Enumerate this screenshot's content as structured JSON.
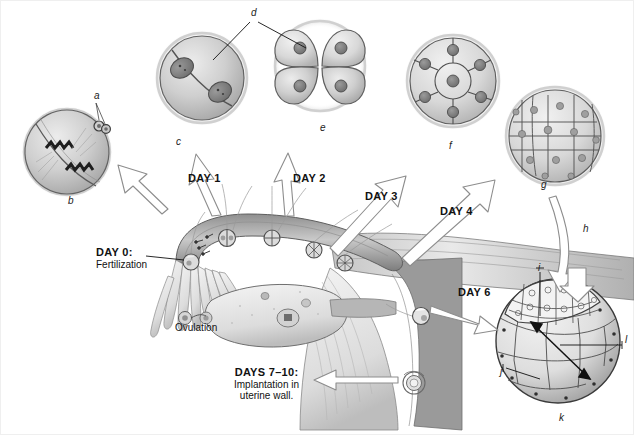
{
  "figure": {
    "background": "#ffffff",
    "ink": "#111111"
  },
  "timeline_labels": [
    {
      "id": "day0",
      "text": "DAY 0:",
      "sub": "Fertilization",
      "x": 96,
      "y": 252
    },
    {
      "id": "day1",
      "text": "DAY 1",
      "sub": "",
      "x": 188,
      "y": 178
    },
    {
      "id": "day2",
      "text": "DAY 2",
      "sub": "",
      "x": 293,
      "y": 178
    },
    {
      "id": "day3",
      "text": "DAY 3",
      "sub": "",
      "x": 365,
      "y": 196
    },
    {
      "id": "day4",
      "text": "DAY 4",
      "sub": "",
      "x": 440,
      "y": 211
    },
    {
      "id": "day6",
      "text": "DAY 6",
      "sub": "",
      "x": 458,
      "y": 292
    },
    {
      "id": "days710",
      "text": "DAYS 7–10:",
      "sub": "Implantation in\nuterine wall.",
      "x": 234,
      "y": 373
    }
  ],
  "anatomy_labels": [
    {
      "id": "ovulation",
      "text": "Ovulation",
      "x": 175,
      "y": 328
    }
  ],
  "stage_letters": [
    {
      "id": "a",
      "text": "a",
      "x": 94,
      "y": 96,
      "role": "polar-bodies"
    },
    {
      "id": "b",
      "text": "b",
      "x": 68,
      "y": 201,
      "role": "zygote-first-cleavage"
    },
    {
      "id": "c",
      "text": "c",
      "x": 176,
      "y": 142,
      "role": "two-cell-stage"
    },
    {
      "id": "d",
      "text": "d",
      "x": 251,
      "y": 13,
      "role": "blastomere"
    },
    {
      "id": "e",
      "text": "e",
      "x": 320,
      "y": 128,
      "role": "four-cell-stage"
    },
    {
      "id": "f",
      "text": "f",
      "x": 449,
      "y": 146,
      "role": "eight-cell-stage"
    },
    {
      "id": "g",
      "text": "g",
      "x": 541,
      "y": 185,
      "role": "morula"
    },
    {
      "id": "h",
      "text": "h",
      "x": 583,
      "y": 229,
      "role": "zona-pellucida"
    },
    {
      "id": "i",
      "text": "i",
      "x": 538,
      "y": 275,
      "role": "inner-cell-mass"
    },
    {
      "id": "j",
      "text": "j",
      "x": 502,
      "y": 372,
      "role": "blastocoel"
    },
    {
      "id": "k",
      "text": "k",
      "x": 559,
      "y": 419,
      "role": "blastocyst"
    },
    {
      "id": "l",
      "text": "l",
      "x": 625,
      "y": 340,
      "role": "trophoblast"
    }
  ],
  "embryo_stages": [
    {
      "id": "b",
      "cx": 67,
      "cy": 152,
      "r": 45,
      "cells": 2,
      "label": "b",
      "caption": "zygote, first cleavage"
    },
    {
      "id": "c",
      "cx": 202,
      "cy": 78,
      "r": 46,
      "cells": 2,
      "label": "c",
      "caption": "2-cell stage"
    },
    {
      "id": "e",
      "cx": 320,
      "cy": 66,
      "r": 45,
      "cells": 4,
      "label": "e",
      "caption": "4-cell stage"
    },
    {
      "id": "f",
      "cx": 453,
      "cy": 81,
      "r": 46,
      "cells": 8,
      "label": "f",
      "caption": "8-cell stage"
    },
    {
      "id": "g",
      "cx": 555,
      "cy": 136,
      "r": 49,
      "cells": 24,
      "label": "g",
      "caption": "morula"
    },
    {
      "id": "k",
      "cx": 558,
      "cy": 341,
      "r": 62,
      "cells": 30,
      "label": "k",
      "caption": "blastocyst"
    }
  ],
  "tract": {
    "fimbriae_count": 9,
    "tube_embryos": 5,
    "ovary_label": "Ovulation"
  }
}
